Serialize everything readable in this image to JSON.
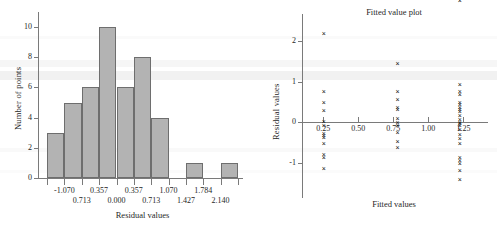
{
  "chart_data": [
    {
      "type": "bar",
      "name": "residual-histogram",
      "title": "",
      "xlabel": "Residual values",
      "ylabel": "Number of points",
      "categories": [
        "-1.070",
        "0.713",
        "0.357",
        "0.000",
        "0.357",
        "0.713",
        "1.070",
        "1.427",
        "1.784",
        "2.140"
      ],
      "tick_labels_upper": [
        "-1.070",
        "0.357",
        "0.357",
        "1.070",
        "1.784"
      ],
      "tick_labels_lower": [
        "0.713",
        "0.000",
        "0.713",
        "1.427",
        "2.140"
      ],
      "values": [
        3,
        5,
        6,
        10,
        6,
        8,
        4,
        0,
        1,
        0,
        1
      ],
      "yticks": [
        "0",
        "2",
        "4",
        "6",
        "8",
        "10"
      ],
      "ylim": [
        0,
        10.6
      ],
      "grid": false,
      "bar_fill": "#b3b3b3",
      "bar_stroke": "#6e6e6e"
    },
    {
      "type": "scatter",
      "name": "fitted-value-plot",
      "title": "Fitted value plot",
      "xlabel": "Fitted values",
      "ylabel": "Residual values",
      "xticks": [
        "0.25",
        "0.50",
        "0.75",
        "1.00",
        "1.25"
      ],
      "yticks": [
        "2",
        "1",
        "0",
        "-1"
      ],
      "xlim": [
        0.17,
        1.34
      ],
      "ylim": [
        -1.55,
        2.45
      ],
      "marker": "x",
      "grid": false,
      "series": [
        {
          "name": "residuals",
          "x": [
            0.255,
            0.255,
            0.255,
            0.255,
            0.255,
            0.255,
            0.255,
            0.255,
            0.255,
            0.255,
            0.255,
            0.255,
            0.255,
            0.78,
            0.78,
            0.78,
            0.78,
            0.78,
            0.78,
            0.78,
            0.78,
            0.78,
            0.78,
            0.78,
            1.225,
            1.225,
            1.225,
            1.225,
            1.225,
            1.225,
            1.225,
            1.225,
            1.225,
            1.225,
            1.225,
            1.225,
            1.225,
            1.225,
            1.225,
            1.225,
            1.225,
            1.225,
            1.225,
            1.225,
            1.225,
            1.225,
            1.225
          ],
          "y": [
            2.18,
            0.76,
            0.5,
            0.3,
            -0.06,
            -0.25,
            -0.36,
            -0.5,
            -0.76,
            -0.84,
            -1.1,
            -0.3,
            0.03,
            0.78,
            0.57,
            0.38,
            0.34,
            0.1,
            0.02,
            -0.06,
            -0.22,
            -0.44,
            -0.59,
            1.46,
            0.93,
            0.77,
            0.69,
            0.49,
            0.44,
            0.38,
            0.33,
            0.27,
            0.19,
            0.08,
            0.02,
            -0.02,
            -0.07,
            -0.17,
            -0.27,
            -0.38,
            -0.49,
            -0.84,
            -0.92,
            -0.99,
            -1.17,
            -1.38
          ]
        }
      ]
    }
  ]
}
